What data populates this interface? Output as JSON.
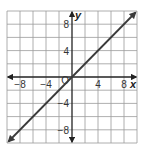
{
  "chart_data": {
    "type": "line",
    "title": "",
    "xlabel": "x",
    "ylabel": "y",
    "xlim": [
      -10,
      10
    ],
    "ylim": [
      -10,
      10
    ],
    "grid": true,
    "grid_step": 2,
    "x_ticks": [
      {
        "value": -8,
        "label": "−8"
      },
      {
        "value": -4,
        "label": "−4"
      },
      {
        "value": 4,
        "label": "4"
      },
      {
        "value": 8,
        "label": "8"
      }
    ],
    "y_ticks": [
      {
        "value": 8,
        "label": "8"
      },
      {
        "value": 4,
        "label": "4"
      },
      {
        "value": -4,
        "label": "−4"
      },
      {
        "value": -8,
        "label": "−8"
      }
    ],
    "origin_label": "O",
    "series": [
      {
        "name": "y = x",
        "points": [
          [
            -10,
            -10
          ],
          [
            0,
            0
          ],
          [
            10,
            10
          ]
        ],
        "arrows_both_ends": true
      }
    ],
    "colors": {
      "grid": "#9a9a9a",
      "axis": "#222222",
      "line": "#3a3a3a",
      "background": "#ffffff"
    }
  }
}
